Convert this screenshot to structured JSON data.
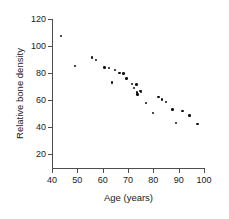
{
  "chart_data": {
    "type": "scatter",
    "title": "",
    "xlabel": "Age (years)",
    "ylabel": "Relative bone density",
    "xlim": [
      40,
      100
    ],
    "ylim": [
      20,
      120
    ],
    "xticks": [
      40,
      50,
      60,
      70,
      80,
      90,
      100
    ],
    "yticks": [
      20,
      40,
      60,
      80,
      100,
      120
    ],
    "grid": false,
    "legend": null,
    "point_color": "#111111",
    "axis_color": "#4d4d4d",
    "background_color": "#ffffff",
    "series": [
      {
        "name": "Relative bone density vs age",
        "points": [
          [
            43.5,
            107.5
          ],
          [
            49.0,
            85.0
          ],
          [
            55.8,
            91.5
          ],
          [
            57.3,
            89.5
          ],
          [
            60.8,
            84.0
          ],
          [
            62.5,
            83.5
          ],
          [
            63.8,
            73.0
          ],
          [
            64.8,
            82.0
          ],
          [
            66.6,
            80.0
          ],
          [
            68.2,
            79.5
          ],
          [
            69.4,
            76.0
          ],
          [
            71.5,
            72.0
          ],
          [
            72.3,
            69.0
          ],
          [
            73.4,
            71.5
          ],
          [
            73.6,
            65.5
          ],
          [
            73.8,
            64.0
          ],
          [
            75.0,
            66.5
          ],
          [
            75.2,
            66.0
          ],
          [
            77.0,
            58.0
          ],
          [
            79.8,
            50.5
          ],
          [
            82.0,
            62.0
          ],
          [
            83.5,
            60.5
          ],
          [
            85.0,
            58.5
          ],
          [
            87.5,
            53.0
          ],
          [
            89.0,
            43.0
          ],
          [
            91.5,
            52.0
          ],
          [
            94.3,
            48.5
          ],
          [
            97.5,
            42.0
          ]
        ]
      }
    ]
  }
}
